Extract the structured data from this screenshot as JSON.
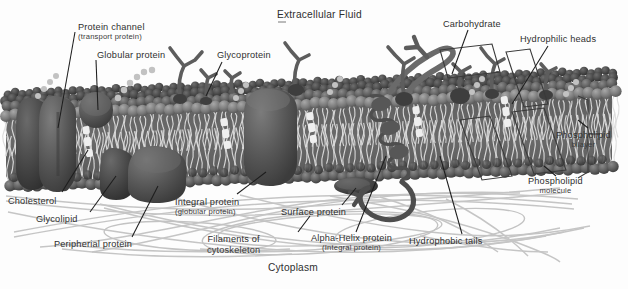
{
  "diagram": {
    "title_top": "Extracellular Fluid",
    "title_bottom": "Cytoplasm",
    "background_color": "#fdfdfd",
    "ink_color": "#2f2f2f",
    "palette": {
      "head_dark": "#4a4a4a",
      "head_mid": "#5f5f5f",
      "head_light": "#7b7b7b",
      "protein_blob": "#5a5a5a",
      "protein_blob_dark": "#474747",
      "tails": "#d9d9d9",
      "filaments": "#b9b9b9",
      "carb_branch": "#5d5d5d",
      "glycolipid_bead": "#bdbdbd",
      "cholesterol": "#efefef",
      "leader_line": "#1e1e1e"
    },
    "labels": [
      {
        "id": "protein-channel",
        "text": "Protein channel",
        "sub": "(transport protein)",
        "x": 78,
        "y": 24
      },
      {
        "id": "globular-protein",
        "text": "Globular protein",
        "sub": "",
        "x": 97,
        "y": 52
      },
      {
        "id": "glycoprotein",
        "text": "Glycoprotein",
        "sub": "",
        "x": 217,
        "y": 52
      },
      {
        "id": "extracellular-fluid",
        "text": "Extracellular Fluid",
        "sub": "",
        "x": 277,
        "y": 10
      },
      {
        "id": "carbohydrate",
        "text": "Carbohydrate",
        "sub": "",
        "x": 443,
        "y": 20
      },
      {
        "id": "hydrophilic-heads",
        "text": "Hydrophilic heads",
        "sub": "",
        "x": 520,
        "y": 36
      },
      {
        "id": "phospholipid-bilayer",
        "text": "Phospholipid",
        "sub": "bilayer",
        "x": 556,
        "y": 131
      },
      {
        "id": "phospholipid-molecule",
        "text": "Phospholipid",
        "sub": "molecule",
        "x": 528,
        "y": 177
      },
      {
        "id": "cholesterol",
        "text": "Cholesterol",
        "sub": "",
        "x": 8,
        "y": 197
      },
      {
        "id": "glycolipid",
        "text": "Glycolipid",
        "sub": "",
        "x": 36,
        "y": 215
      },
      {
        "id": "peripherial-protein",
        "text": "Peripherial protein",
        "sub": "",
        "x": 54,
        "y": 240
      },
      {
        "id": "integral-protein",
        "text": "Integral protein",
        "sub": "(globular protein)",
        "x": 175,
        "y": 198
      },
      {
        "id": "filaments-of-cytoskeleton",
        "text": "Filaments of",
        "sub": "cytoskeleton",
        "x": 207,
        "y": 235
      },
      {
        "id": "surface-protein",
        "text": "Surface protein",
        "sub": "",
        "x": 281,
        "y": 208
      },
      {
        "id": "alpha-helix-protein",
        "text": "Alpha-Helix protein",
        "sub": "(Integral protein)",
        "x": 311,
        "y": 234
      },
      {
        "id": "hydrophobic-tails",
        "text": "Hydrophobic tails",
        "sub": "",
        "x": 409,
        "y": 237
      }
    ]
  }
}
